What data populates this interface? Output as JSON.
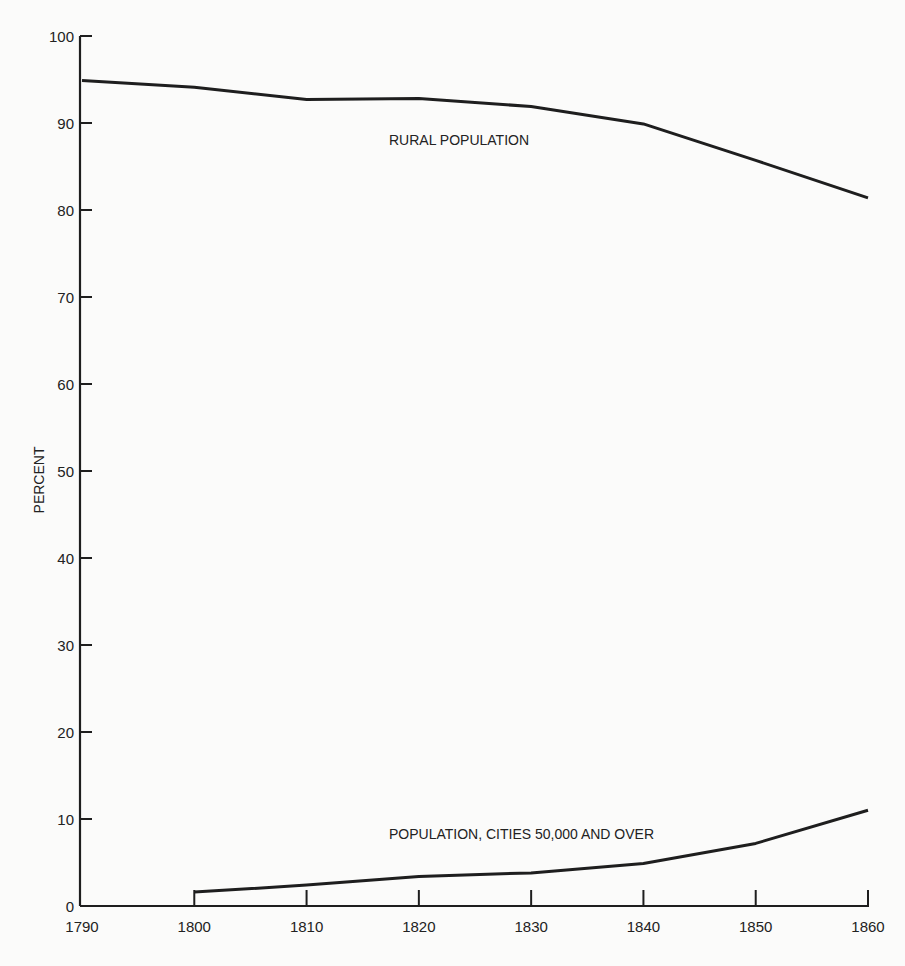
{
  "chart_data": {
    "type": "line",
    "title": "",
    "xlabel": "",
    "ylabel": "PERCENT",
    "x": [
      1790,
      1800,
      1810,
      1820,
      1830,
      1840,
      1850,
      1860
    ],
    "xlim": [
      1790,
      1860
    ],
    "ylim": [
      0,
      100
    ],
    "xticks": [
      "1790",
      "1800",
      "1810",
      "1820",
      "1830",
      "1840",
      "1850",
      "1860"
    ],
    "yticks": [
      "0",
      "10",
      "20",
      "30",
      "40",
      "50",
      "60",
      "70",
      "80",
      "90",
      "100"
    ],
    "grid": false,
    "legend": "inline labels",
    "series": [
      {
        "name": "RURAL POPULATION",
        "x": [
          1790,
          1800,
          1810,
          1820,
          1830,
          1840,
          1850,
          1860
        ],
        "values": [
          94.9,
          94.1,
          92.7,
          92.8,
          91.9,
          89.9,
          85.7,
          81.4
        ]
      },
      {
        "name": "POPULATION, CITIES 50,000 AND OVER",
        "x": [
          1800,
          1810,
          1820,
          1830,
          1840,
          1850,
          1860
        ],
        "values": [
          1.6,
          2.4,
          3.4,
          3.8,
          4.9,
          7.2,
          11.0
        ]
      }
    ],
    "annotations": [
      "RURAL POPULATION",
      "POPULATION, CITIES 50,000 AND OVER"
    ]
  },
  "colors": {
    "line": "#1e1e1e",
    "background": "#fbfbfa"
  }
}
